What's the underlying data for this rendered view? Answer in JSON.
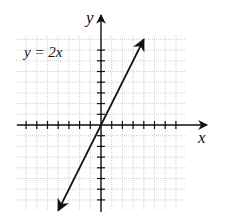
{
  "chart_data": {
    "type": "line",
    "title": "",
    "equation_label": "y = 2x",
    "xlabel": "x",
    "ylabel": "y",
    "xlim": [
      -8,
      6
    ],
    "ylim": [
      -8,
      8
    ],
    "grid": true,
    "tick_spacing": 1,
    "tick_labels": false,
    "series": [
      {
        "name": "y = 2x",
        "x": [
          -4,
          -2,
          0,
          2,
          4
        ],
        "y": [
          -8,
          -4,
          0,
          4,
          8
        ],
        "arrows": "both"
      }
    ],
    "colors": {
      "line": "#111111",
      "grid": "#bdbdbd",
      "axis": "#111111"
    }
  }
}
